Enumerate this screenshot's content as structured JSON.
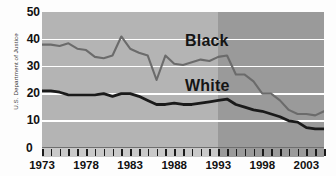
{
  "source_credit": "U.S. Department of Justice",
  "axes": {
    "y_ticks": [
      "50",
      "40",
      "30",
      "20",
      "10",
      "0"
    ],
    "x_ticks": [
      "1973",
      "1978",
      "1983",
      "1988",
      "1993",
      "1998",
      "2003"
    ]
  },
  "series_labels": {
    "black": "Black",
    "white": "White"
  },
  "colors": {
    "plot_background_early": "#b4b4b4",
    "plot_background_late": "#9a9a9a",
    "gridline": "#ffffff",
    "black_series_line": "#6b6b6b",
    "white_series_line": "#1a1a1a",
    "text": "#111111"
  },
  "chart_data": {
    "type": "line",
    "title": "",
    "subtitle": "",
    "xlabel": "",
    "ylabel": "",
    "xlim": [
      1973,
      2005
    ],
    "ylim": [
      0,
      50
    ],
    "grid": true,
    "gridlines_y": [
      10,
      20,
      30,
      40
    ],
    "legend_position": "inline-annotation",
    "annotations": [
      {
        "text": "Black",
        "x": 1990,
        "y": 38
      },
      {
        "text": "White",
        "x": 1990,
        "y": 22
      }
    ],
    "shaded_region": {
      "from": 1993,
      "to": 2005,
      "note": "darker background band"
    },
    "x": [
      1973,
      1974,
      1975,
      1976,
      1977,
      1978,
      1979,
      1980,
      1981,
      1982,
      1983,
      1984,
      1985,
      1986,
      1987,
      1988,
      1989,
      1990,
      1991,
      1992,
      1993,
      1994,
      1995,
      1996,
      1997,
      1998,
      1999,
      2000,
      2001,
      2002,
      2003,
      2004,
      2005
    ],
    "series": [
      {
        "name": "Black",
        "values": [
          38,
          38,
          37.5,
          38.5,
          36.5,
          36,
          33.5,
          33,
          34,
          41,
          36.5,
          35,
          34,
          25,
          34,
          31,
          30.5,
          31.5,
          32.5,
          32,
          33.5,
          34,
          27,
          27,
          24.5,
          20,
          20,
          17.5,
          14,
          12.5,
          12.5,
          12,
          13.5
        ]
      },
      {
        "name": "White",
        "values": [
          21,
          21,
          20.5,
          19.5,
          19.5,
          19.5,
          19.5,
          20,
          19,
          20,
          20,
          19,
          17.5,
          16,
          16,
          16.5,
          16,
          16,
          16.5,
          17,
          17.5,
          18,
          16,
          15,
          14,
          13.5,
          12.5,
          11.5,
          10,
          9.5,
          7.5,
          7,
          7
        ]
      }
    ]
  }
}
